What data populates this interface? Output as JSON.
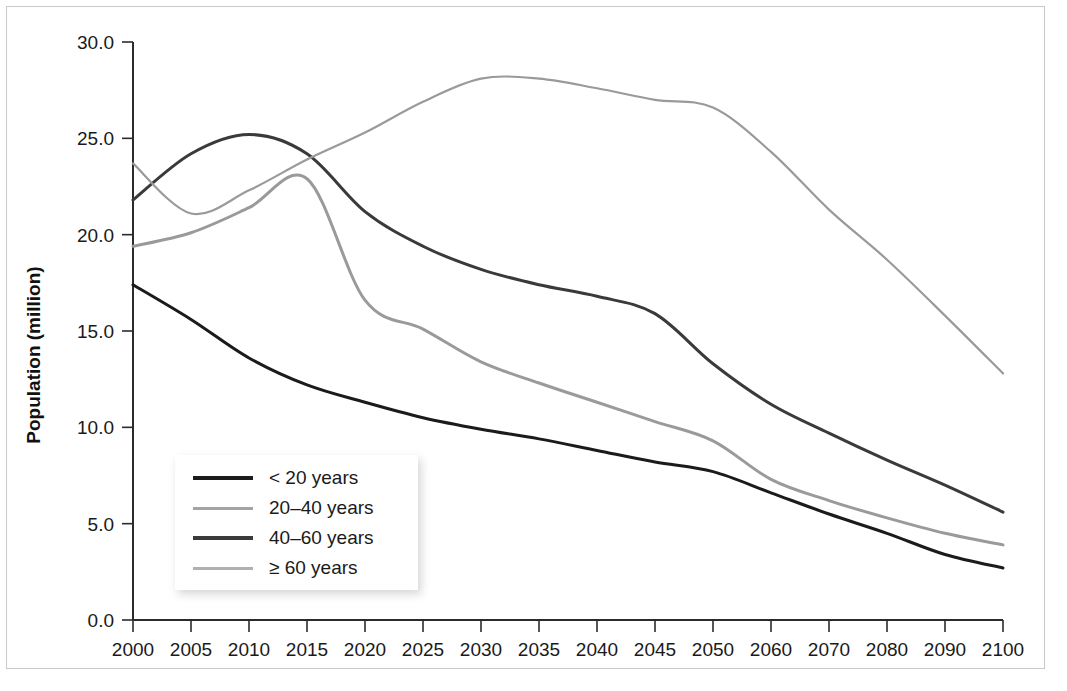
{
  "chart_data": {
    "type": "line",
    "title": "",
    "xlabel": "",
    "ylabel": "Population (million)",
    "xlim": [
      2000,
      2100
    ],
    "ylim": [
      0.0,
      30.0
    ],
    "grid": false,
    "legend_position": "inside-lower-left",
    "x_tick_labels": [
      "2000",
      "2005",
      "2010",
      "2015",
      "2020",
      "2025",
      "2030",
      "2035",
      "2040",
      "2045",
      "2050",
      "2060",
      "2070",
      "2080",
      "2090",
      "2100"
    ],
    "y_tick_labels": [
      "0.0",
      "5.0",
      "10.0",
      "15.0",
      "20.0",
      "25.0",
      "30.0"
    ],
    "y_ticks": [
      0.0,
      5.0,
      10.0,
      15.0,
      20.0,
      25.0,
      30.0
    ],
    "x_categories": [
      2000,
      2005,
      2010,
      2015,
      2020,
      2025,
      2030,
      2035,
      2040,
      2045,
      2050,
      2060,
      2070,
      2080,
      2090,
      2100
    ],
    "series": [
      {
        "name": "< 20 years",
        "color": "#1b1b1b",
        "width": 3.0,
        "values": [
          17.4,
          15.6,
          13.6,
          12.2,
          11.3,
          10.5,
          9.9,
          9.4,
          8.8,
          8.2,
          7.7,
          6.6,
          5.5,
          4.5,
          3.4,
          2.7
        ]
      },
      {
        "name": "20–40 years",
        "color": "#9a9a9a",
        "width": 3.0,
        "values": [
          19.4,
          20.1,
          21.4,
          22.9,
          16.6,
          15.1,
          13.4,
          12.3,
          11.3,
          10.3,
          9.3,
          7.3,
          6.2,
          5.3,
          4.5,
          3.9
        ]
      },
      {
        "name": "40–60 years",
        "color": "#3a3a3a",
        "width": 3.0,
        "values": [
          21.8,
          24.2,
          25.2,
          24.2,
          21.2,
          19.4,
          18.2,
          17.4,
          16.8,
          15.9,
          13.3,
          11.2,
          9.7,
          8.3,
          7.0,
          5.6
        ]
      },
      {
        "name": "≥ 60 years",
        "color": "#9a9a9a",
        "width": 2.2,
        "values": [
          23.7,
          21.1,
          22.3,
          23.9,
          25.3,
          26.9,
          28.1,
          28.1,
          27.6,
          27.0,
          26.6,
          24.3,
          21.3,
          18.7,
          15.8,
          12.8
        ]
      }
    ],
    "legend_entries": [
      {
        "label": "< 20 years",
        "color": "#1b1b1b",
        "width": 4
      },
      {
        "label": "20–40 years",
        "color": "#a3a3a3",
        "width": 3
      },
      {
        "label": "40–60 years",
        "color": "#3a3a3a",
        "width": 4
      },
      {
        "label": "≥ 60 years",
        "color": "#b0b0b0",
        "width": 3
      }
    ]
  }
}
